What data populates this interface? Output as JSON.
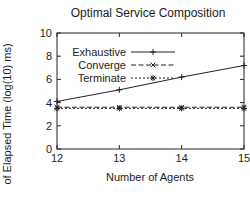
{
  "window": {
    "background": "#ffffff",
    "ink": "#1c1c1c",
    "line_color": "#222222"
  },
  "chart_data": {
    "type": "line",
    "title": "Optimal Service Composition",
    "xlabel": "Number of Agents",
    "ylabel": "of Elapsed Time (log(10) ms)",
    "x": [
      12,
      13,
      14,
      15
    ],
    "xlim": [
      12,
      15
    ],
    "ylim": [
      0,
      10
    ],
    "xticks": [
      12,
      13,
      14,
      15
    ],
    "yticks": [
      0,
      2,
      4,
      6,
      8,
      10
    ],
    "grid": false,
    "legend_position": "top-left",
    "series": [
      {
        "name": "Exhaustive",
        "marker": "plus",
        "line": "solid",
        "color": "#222222",
        "values": [
          4.1,
          5.1,
          6.2,
          7.2
        ]
      },
      {
        "name": "Converge",
        "marker": "cross",
        "line": "dashed",
        "color": "#222222",
        "values": [
          3.6,
          3.6,
          3.6,
          3.6
        ]
      },
      {
        "name": "Terminate",
        "marker": "asterisk",
        "line": "dotted",
        "color": "#222222",
        "values": [
          3.5,
          3.5,
          3.5,
          3.5
        ]
      }
    ]
  }
}
